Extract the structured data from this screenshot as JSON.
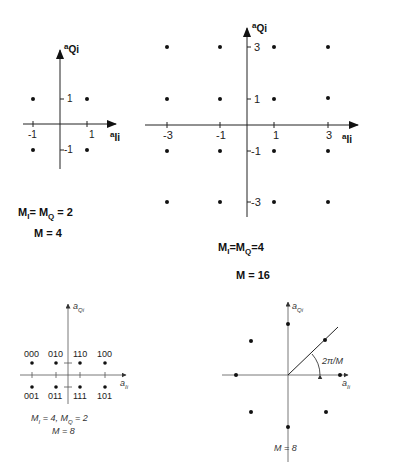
{
  "diagrams": {
    "qam4": {
      "x_axis_label": "a_Ii",
      "y_axis_label": "a_Qi",
      "x_ticks": [
        "-1",
        "1"
      ],
      "y_ticks": [
        "1",
        "-1"
      ],
      "points": [
        [
          -1,
          1
        ],
        [
          1,
          1
        ],
        [
          -1,
          -1
        ],
        [
          1,
          -1
        ]
      ],
      "caption_line1": "M_I = M_Q = 2",
      "caption_line2": "M = 4"
    },
    "qam16": {
      "x_axis_label": "a_Ii",
      "y_axis_label": "a_Qi",
      "x_ticks": [
        "-3",
        "-1",
        "1",
        "3"
      ],
      "y_ticks": [
        "3",
        "1",
        "-1",
        "-3"
      ],
      "points": "4x4 grid at {-3,-1,1,3}",
      "caption_line1": "M_I = M_Q = 4",
      "caption_line2": "M = 16"
    },
    "qam8": {
      "x_axis_label": "a_Ii",
      "y_axis_label": "a_Qi",
      "top_labels": [
        "000",
        "010",
        "110",
        "100"
      ],
      "bottom_labels": [
        "001",
        "011",
        "111",
        "101"
      ],
      "caption_line1": "M_I = 4, M_Q = 2",
      "caption_line2": "M = 8"
    },
    "psk8": {
      "x_axis_label": "a_Ii",
      "y_axis_label": "a_Qi",
      "angle_label": "2π/M",
      "caption": "M = 8"
    }
  },
  "text": {
    "a": "a",
    "Ii": "Ii",
    "Qi": "Qi",
    "Mi_eq_MQ_eq_2": "M",
    "tl_cap1_a": "M",
    "tl_cap1_sub1": "I",
    "tl_cap1_b": "= M",
    "tl_cap1_sub2": "Q",
    "tl_cap1_c": "= 2",
    "tl_cap2": "M = 4",
    "tr_cap1_a": "M",
    "tr_cap1_sub1": "I",
    "tr_cap1_b": "=M",
    "tr_cap1_sub2": "Q",
    "tr_cap1_c": "=4",
    "tr_cap2": "M = 16",
    "bl_cap1": "M",
    "bl_cap1_sub1": "I",
    "bl_cap1_b": " = 4,  M",
    "bl_cap1_sub2": "Q",
    "bl_cap1_c": " = 2",
    "bl_cap2": "M = 8",
    "br_cap": "M = 8",
    "angle": "2π/M",
    "t_m1": "-1",
    "t_1": "1",
    "t_m3": "-3",
    "t_3": "3",
    "b000": "000",
    "b010": "010",
    "b110": "110",
    "b100": "100",
    "b001": "001",
    "b011": "011",
    "b111": "111",
    "b101": "101"
  }
}
